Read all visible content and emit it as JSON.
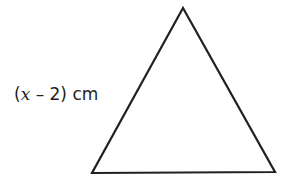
{
  "diagram": {
    "shape": "triangle",
    "vertices": {
      "apex": [
        183,
        8
      ],
      "bottom_left": [
        92,
        173
      ],
      "bottom_right": [
        275,
        172
      ]
    },
    "stroke_color": "#231f20",
    "stroke_width": 2.2,
    "side_label": {
      "open_paren": "(",
      "variable": "x",
      "operator_constant": " – 2)",
      "unit": " cm",
      "full_text": "(x – 2) cm",
      "side": "left"
    }
  }
}
